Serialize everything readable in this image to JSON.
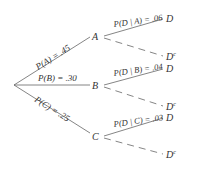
{
  "diagram": {
    "type": "probability-tree",
    "root": {
      "x": 14,
      "y": 85
    },
    "first_level": [
      {
        "node": "A",
        "prob_label": "P(A) = .45",
        "x": 94,
        "y": 36
      },
      {
        "node": "B",
        "prob_label": "P(B) = .30",
        "x": 94,
        "y": 85
      },
      {
        "node": "C",
        "prob_label": "P(C) = .25",
        "x": 94,
        "y": 136
      }
    ],
    "second_level": [
      {
        "parent": "A",
        "cond_label": "P(D | A) = .06",
        "d": "D",
        "dc": "D",
        "dc_sup": "c"
      },
      {
        "parent": "B",
        "cond_label": "P(D | B) = .04",
        "d": "D",
        "dc": "D",
        "dc_sup": "c"
      },
      {
        "parent": "C",
        "cond_label": "P(D | C) = .03",
        "d": "D",
        "dc": "D",
        "dc_sup": "c"
      }
    ],
    "colors": {
      "line": "#666666",
      "text": "#333333",
      "background": "#ffffff"
    }
  }
}
